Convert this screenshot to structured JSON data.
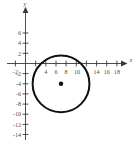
{
  "figure": {
    "background_color": "#ffffff",
    "axis_color": "#3a3a3a",
    "curve_color": "#111111",
    "label_color": "#4a4a4a"
  },
  "chart_data": {
    "type": "scatter",
    "title": "",
    "subtitle": "",
    "xlabel": "x",
    "ylabel": "y",
    "xlim": [
      -3,
      19.5
    ],
    "ylim": [
      -15.5,
      7.5
    ],
    "grid": false,
    "legend": null,
    "x_ticks": [
      -2,
      4,
      6,
      8,
      10,
      14,
      16,
      18
    ],
    "x_tick_labels": [
      "-2",
      "4",
      "6",
      "8",
      "10",
      "14",
      "16",
      "18"
    ],
    "x_tick_positions_all": [
      -2,
      2,
      4,
      6,
      8,
      10,
      12,
      14,
      16,
      18
    ],
    "y_ticks": [
      6,
      4,
      2,
      -2,
      -4,
      -6,
      -8,
      -10,
      -12,
      -14
    ],
    "y_tick_labels": [
      "6",
      "4",
      "2",
      "-2",
      "-4",
      "-6",
      "-8",
      "-10",
      "-12",
      "-14"
    ],
    "series": [
      {
        "name": "circle",
        "shape": "circle",
        "center_x": 7,
        "center_y": -4,
        "radius": 5.6,
        "stroke_width": 2,
        "color": "#111111"
      },
      {
        "name": "center-point",
        "shape": "point",
        "x": 7,
        "y": -4,
        "color": "#111111"
      }
    ]
  }
}
